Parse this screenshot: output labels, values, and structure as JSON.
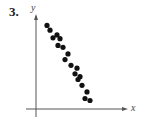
{
  "exercise": {
    "number": "3."
  },
  "chart_data": {
    "type": "scatter",
    "title": "",
    "xlabel": "x",
    "ylabel": "y",
    "grid": false,
    "legend": null,
    "ticks": "none",
    "xlim": [
      0,
      100
    ],
    "ylim": [
      0,
      100
    ],
    "points": [
      {
        "x": 11,
        "y": 88
      },
      {
        "x": 14,
        "y": 83
      },
      {
        "x": 17,
        "y": 75
      },
      {
        "x": 21,
        "y": 78
      },
      {
        "x": 24,
        "y": 74
      },
      {
        "x": 22,
        "y": 67
      },
      {
        "x": 27,
        "y": 65
      },
      {
        "x": 32,
        "y": 58
      },
      {
        "x": 29,
        "y": 52
      },
      {
        "x": 35,
        "y": 46
      },
      {
        "x": 41,
        "y": 43
      },
      {
        "x": 39,
        "y": 37
      },
      {
        "x": 44,
        "y": 34
      },
      {
        "x": 42,
        "y": 31
      },
      {
        "x": 46,
        "y": 25
      },
      {
        "x": 51,
        "y": 18
      },
      {
        "x": 49,
        "y": 11
      },
      {
        "x": 54,
        "y": 9
      }
    ],
    "annotation": "Strong negative linear correlation"
  },
  "style": {
    "dot_color": "#111111",
    "axis_color": "#555555"
  }
}
